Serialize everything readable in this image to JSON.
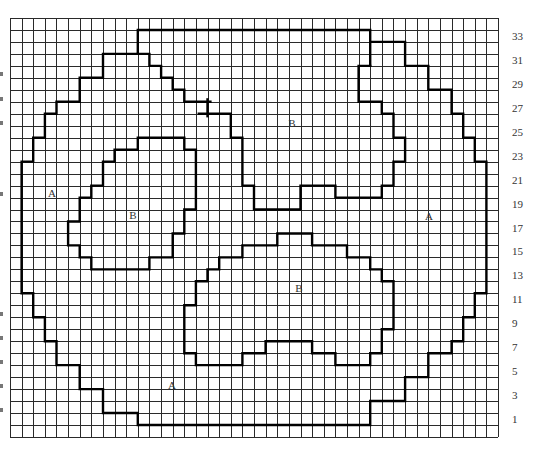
{
  "grid": {
    "left": 10,
    "top": 18,
    "cols": 42,
    "rows": 35,
    "cell_w": 11.62,
    "cell_h": 11.97,
    "line_color": "#2a2a2a",
    "outline_color": "#000000"
  },
  "row_labels": [
    {
      "text": "33",
      "row": 1
    },
    {
      "text": "31",
      "row": 3
    },
    {
      "text": "29",
      "row": 5
    },
    {
      "text": "27",
      "row": 7
    },
    {
      "text": "25",
      "row": 9
    },
    {
      "text": "23",
      "row": 11
    },
    {
      "text": "21",
      "row": 13
    },
    {
      "text": "19",
      "row": 15
    },
    {
      "text": "17",
      "row": 17
    },
    {
      "text": "15",
      "row": 19
    },
    {
      "text": "13",
      "row": 21
    },
    {
      "text": "11",
      "row": 23
    },
    {
      "text": "9",
      "row": 25
    },
    {
      "text": "7",
      "row": 27
    },
    {
      "text": "5",
      "row": 29
    },
    {
      "text": "3",
      "row": 31
    },
    {
      "text": "1",
      "row": 33
    }
  ],
  "region_labels": [
    {
      "text": "A",
      "x": 52,
      "y": 197
    },
    {
      "text": "B",
      "x": 133,
      "y": 219
    },
    {
      "text": "B",
      "x": 292,
      "y": 127
    },
    {
      "text": "A",
      "x": 429,
      "y": 220
    },
    {
      "text": "B",
      "x": 299,
      "y": 292
    },
    {
      "text": "A",
      "x": 172,
      "y": 389
    }
  ],
  "outlines": [
    {
      "name": "top-b-outer",
      "points": [
        [
          11,
          3
        ],
        [
          11,
          1
        ],
        [
          31,
          1
        ],
        [
          31,
          4
        ]
      ]
    },
    {
      "name": "outer-a-left",
      "points": [
        [
          11,
          3
        ],
        [
          8,
          3
        ],
        [
          8,
          5
        ],
        [
          6,
          5
        ],
        [
          6,
          7
        ],
        [
          4,
          7
        ],
        [
          4,
          8
        ],
        [
          3,
          8
        ],
        [
          3,
          10
        ],
        [
          2,
          10
        ],
        [
          2,
          12
        ],
        [
          1,
          12
        ],
        [
          1,
          23
        ],
        [
          2,
          23
        ],
        [
          2,
          25
        ],
        [
          3,
          25
        ],
        [
          3,
          27
        ],
        [
          4,
          27
        ],
        [
          4,
          29
        ],
        [
          6,
          29
        ],
        [
          6,
          31
        ],
        [
          8,
          31
        ],
        [
          8,
          33
        ],
        [
          11,
          33
        ],
        [
          11,
          34
        ],
        [
          31,
          34
        ],
        [
          31,
          32
        ],
        [
          34,
          32
        ],
        [
          34,
          30
        ],
        [
          36,
          30
        ],
        [
          36,
          28
        ],
        [
          38,
          28
        ],
        [
          38,
          27
        ],
        [
          39,
          27
        ],
        [
          39,
          25
        ],
        [
          40,
          25
        ],
        [
          40,
          23
        ],
        [
          41,
          23
        ],
        [
          41,
          12
        ],
        [
          40,
          12
        ],
        [
          40,
          10
        ],
        [
          39,
          10
        ],
        [
          39,
          8
        ],
        [
          38,
          8
        ],
        [
          38,
          6
        ],
        [
          36,
          6
        ],
        [
          36,
          4
        ],
        [
          34,
          4
        ],
        [
          34,
          2
        ],
        [
          31,
          2
        ]
      ]
    },
    {
      "name": "top-b-left-edge-upper",
      "points": [
        [
          11,
          3
        ],
        [
          12,
          3
        ],
        [
          12,
          4
        ],
        [
          13,
          4
        ],
        [
          13,
          5
        ],
        [
          14,
          5
        ],
        [
          14,
          6
        ],
        [
          15,
          6
        ],
        [
          15,
          7
        ],
        [
          17.25,
          7
        ]
      ]
    },
    {
      "name": "top-b-cross-tick",
      "points": [
        [
          17,
          6.8
        ],
        [
          17,
          8.2
        ]
      ]
    },
    {
      "name": "top-b-left-edge-lower",
      "points": [
        [
          16.25,
          8
        ],
        [
          19,
          8
        ],
        [
          19,
          10
        ],
        [
          20,
          10
        ],
        [
          20,
          14
        ],
        [
          21,
          14
        ],
        [
          21,
          16
        ],
        [
          25,
          16
        ],
        [
          25,
          14
        ],
        [
          28,
          14
        ],
        [
          28,
          15
        ],
        [
          32,
          15
        ],
        [
          32,
          14
        ],
        [
          33,
          14
        ],
        [
          33,
          12
        ],
        [
          34,
          12
        ],
        [
          34,
          10
        ],
        [
          33,
          10
        ],
        [
          33,
          8
        ],
        [
          32,
          8
        ],
        [
          32,
          7
        ],
        [
          30,
          7
        ],
        [
          30,
          4
        ],
        [
          31,
          4
        ]
      ]
    },
    {
      "name": "left-b",
      "points": [
        [
          11,
          10
        ],
        [
          15,
          10
        ],
        [
          15,
          11
        ],
        [
          16,
          11
        ],
        [
          16,
          16
        ],
        [
          15,
          16
        ],
        [
          15,
          18
        ],
        [
          14,
          18
        ],
        [
          14,
          20
        ],
        [
          12,
          20
        ],
        [
          12,
          21
        ],
        [
          7,
          21
        ],
        [
          7,
          20
        ],
        [
          6,
          20
        ],
        [
          6,
          19
        ],
        [
          5,
          19
        ],
        [
          5,
          17
        ],
        [
          6,
          17
        ],
        [
          6,
          15
        ],
        [
          7,
          15
        ],
        [
          7,
          14
        ],
        [
          8,
          14
        ],
        [
          8,
          12
        ],
        [
          9,
          12
        ],
        [
          9,
          11
        ],
        [
          11,
          11
        ],
        [
          11,
          10
        ]
      ]
    },
    {
      "name": "lower-b",
      "points": [
        [
          20,
          19
        ],
        [
          23,
          19
        ],
        [
          23,
          18
        ],
        [
          26,
          18
        ],
        [
          26,
          19
        ],
        [
          29,
          19
        ],
        [
          29,
          20
        ],
        [
          31,
          20
        ],
        [
          31,
          21
        ],
        [
          32,
          21
        ],
        [
          32,
          22
        ],
        [
          33,
          22
        ],
        [
          33,
          26
        ],
        [
          32,
          26
        ],
        [
          32,
          28
        ],
        [
          31,
          28
        ],
        [
          31,
          29
        ],
        [
          28,
          29
        ],
        [
          28,
          28
        ],
        [
          26,
          28
        ],
        [
          26,
          27
        ],
        [
          22,
          27
        ],
        [
          22,
          28
        ],
        [
          20,
          28
        ],
        [
          20,
          29
        ],
        [
          16,
          29
        ],
        [
          16,
          28
        ],
        [
          15,
          28
        ],
        [
          15,
          24
        ],
        [
          16,
          24
        ],
        [
          16,
          22
        ],
        [
          17,
          22
        ],
        [
          17,
          21
        ],
        [
          18,
          21
        ],
        [
          18,
          20
        ],
        [
          20,
          20
        ],
        [
          20,
          19
        ]
      ]
    }
  ],
  "edge_marks": [
    {
      "y": 74
    },
    {
      "y": 99
    },
    {
      "y": 123
    },
    {
      "y": 194
    },
    {
      "y": 314
    },
    {
      "y": 338
    },
    {
      "y": 362
    },
    {
      "y": 386
    },
    {
      "y": 410
    }
  ]
}
